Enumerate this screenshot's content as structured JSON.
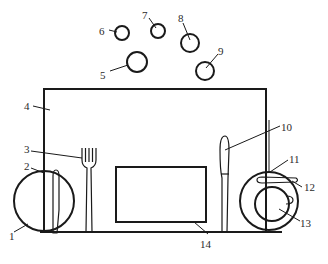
{
  "diagram": {
    "stroke_color": "#1a1a1a",
    "background": "#ffffff",
    "labels": [
      {
        "id": "1",
        "text": "1"
      },
      {
        "id": "2",
        "text": "2"
      },
      {
        "id": "3",
        "text": "3"
      },
      {
        "id": "4",
        "text": "4"
      },
      {
        "id": "5",
        "text": "5"
      },
      {
        "id": "6",
        "text": "6"
      },
      {
        "id": "7",
        "text": "7"
      },
      {
        "id": "8",
        "text": "8"
      },
      {
        "id": "9",
        "text": "9"
      },
      {
        "id": "10",
        "text": "10"
      },
      {
        "id": "11",
        "text": "11"
      },
      {
        "id": "12",
        "text": "12"
      },
      {
        "id": "13",
        "text": "13"
      },
      {
        "id": "14",
        "text": "14"
      }
    ]
  }
}
